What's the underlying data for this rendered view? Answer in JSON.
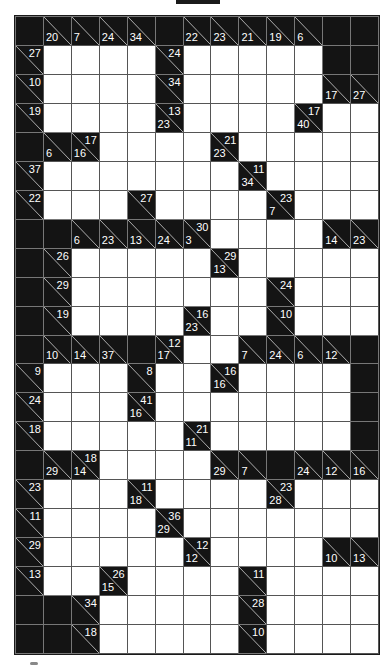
{
  "puzzle": {
    "type": "kakuro",
    "cols": 13,
    "rows": 22,
    "legend": {
      "B": "black cell",
      "W": "white entry cell",
      "clue": "d = down sum, r = right sum"
    },
    "grid": [
      [
        "B",
        {
          "d": 20
        },
        {
          "d": 7
        },
        {
          "d": 24
        },
        {
          "d": 34
        },
        "B",
        {
          "d": 22
        },
        {
          "d": 23
        },
        {
          "d": 21
        },
        {
          "d": 19
        },
        {
          "d": 6
        },
        "B",
        "B"
      ],
      [
        {
          "r": 27
        },
        "W",
        "W",
        "W",
        "W",
        {
          "r": 24
        },
        "W",
        "W",
        "W",
        "W",
        "W",
        "B",
        "B"
      ],
      [
        {
          "r": 10
        },
        "W",
        "W",
        "W",
        "W",
        {
          "r": 34
        },
        "W",
        "W",
        "W",
        "W",
        "W",
        {
          "d": 17
        },
        {
          "d": 27
        }
      ],
      [
        {
          "r": 19
        },
        "W",
        "W",
        "W",
        "W",
        {
          "d": 23,
          "r": 13
        },
        "W",
        "W",
        "W",
        "W",
        {
          "d": 40,
          "r": 17
        },
        "W",
        "W"
      ],
      [
        "B",
        {
          "d": 6
        },
        {
          "d": 16,
          "r": 17
        },
        "W",
        "W",
        "W",
        "W",
        {
          "d": 23,
          "r": 21
        },
        "W",
        "W",
        "W",
        "W",
        "W"
      ],
      [
        {
          "r": 37
        },
        "W",
        "W",
        "W",
        "W",
        "W",
        "W",
        "W",
        {
          "d": 34,
          "r": 11
        },
        "W",
        "W",
        "W",
        "W"
      ],
      [
        {
          "r": 22
        },
        "W",
        "W",
        "W",
        {
          "r": 27
        },
        "W",
        "W",
        "W",
        "W",
        {
          "d": 7,
          "r": 23
        },
        "W",
        "W",
        "W"
      ],
      [
        "B",
        "B",
        {
          "d": 6
        },
        {
          "d": 23
        },
        {
          "d": 13
        },
        {
          "d": 24
        },
        {
          "d": 3,
          "r": 30
        },
        "W",
        "W",
        "W",
        "W",
        {
          "d": 14
        },
        {
          "d": 23
        }
      ],
      [
        "B",
        {
          "r": 26
        },
        "W",
        "W",
        "W",
        "W",
        "W",
        {
          "d": 13,
          "r": 29
        },
        "W",
        "W",
        "W",
        "W",
        "W"
      ],
      [
        "B",
        {
          "r": 29
        },
        "W",
        "W",
        "W",
        "W",
        "W",
        "W",
        "W",
        {
          "r": 24
        },
        "W",
        "W",
        "W"
      ],
      [
        "B",
        {
          "r": 19
        },
        "W",
        "W",
        "W",
        "W",
        {
          "d": 23,
          "r": 16
        },
        "W",
        "W",
        {
          "r": 10
        },
        "W",
        "W",
        "W"
      ],
      [
        "B",
        {
          "d": 10
        },
        {
          "d": 14
        },
        {
          "d": 37
        },
        "B",
        {
          "d": 17,
          "r": 12
        },
        "W",
        "W",
        {
          "d": 7
        },
        {
          "d": 24
        },
        {
          "d": 6
        },
        {
          "d": 12
        },
        "B"
      ],
      [
        {
          "r": 9
        },
        "W",
        "W",
        "W",
        {
          "r": 8
        },
        "W",
        "W",
        {
          "d": 16,
          "r": 16
        },
        "W",
        "W",
        "W",
        "W",
        "B"
      ],
      [
        {
          "r": 24
        },
        "W",
        "W",
        "W",
        {
          "d": 16,
          "r": 41
        },
        "W",
        "W",
        "W",
        "W",
        "W",
        "W",
        "W",
        "B"
      ],
      [
        {
          "r": 18
        },
        "W",
        "W",
        "W",
        "W",
        "W",
        {
          "d": 11,
          "r": 21
        },
        "W",
        "W",
        "W",
        "W",
        "W",
        "B"
      ],
      [
        "B",
        {
          "d": 29
        },
        {
          "d": 14,
          "r": 18
        },
        "W",
        "W",
        "W",
        "W",
        {
          "d": 29
        },
        {
          "d": 7
        },
        "B",
        {
          "d": 24
        },
        {
          "d": 12
        },
        {
          "d": 16
        }
      ],
      [
        {
          "r": 23
        },
        "W",
        "W",
        "W",
        {
          "d": 18,
          "r": 11
        },
        "W",
        "W",
        "W",
        "W",
        {
          "d": 28,
          "r": 23
        },
        "W",
        "W",
        "W"
      ],
      [
        {
          "r": 11
        },
        "W",
        "W",
        "W",
        "W",
        {
          "d": 29,
          "r": 36
        },
        "W",
        "W",
        "W",
        "W",
        "W",
        "W",
        "W"
      ],
      [
        {
          "r": 29
        },
        "W",
        "W",
        "W",
        "W",
        "W",
        {
          "d": 12,
          "r": 12
        },
        "W",
        "W",
        "W",
        "W",
        {
          "d": 10
        },
        {
          "d": 13
        }
      ],
      [
        {
          "r": 13
        },
        "W",
        "W",
        {
          "d": 15,
          "r": 26
        },
        "W",
        "W",
        "W",
        "W",
        {
          "r": 11
        },
        "W",
        "W",
        "W",
        "W"
      ],
      [
        "B",
        "B",
        {
          "r": 34
        },
        "W",
        "W",
        "W",
        "W",
        "W",
        {
          "r": 28
        },
        "W",
        "W",
        "W",
        "W"
      ],
      [
        "B",
        "B",
        {
          "r": 18
        },
        "W",
        "W",
        "W",
        "W",
        "W",
        {
          "r": 10
        },
        "W",
        "W",
        "W",
        "W"
      ]
    ]
  },
  "colors": {
    "black_cell": "#141414",
    "white_cell": "#ffffff",
    "grid_line": "#555555",
    "clue_text": "#ffffff"
  }
}
